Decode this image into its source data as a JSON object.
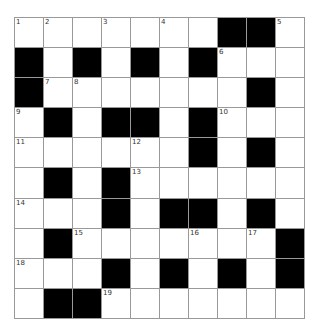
{
  "puzzle": {
    "rows": 10,
    "cols": 10,
    "grid": [
      [
        "W",
        "W",
        "W",
        "W",
        "W",
        "W",
        "W",
        "B",
        "B",
        "W"
      ],
      [
        "B",
        "W",
        "B",
        "W",
        "B",
        "W",
        "B",
        "W",
        "W",
        "W"
      ],
      [
        "B",
        "W",
        "W",
        "W",
        "W",
        "W",
        "W",
        "W",
        "B",
        "W"
      ],
      [
        "W",
        "B",
        "W",
        "B",
        "B",
        "W",
        "B",
        "W",
        "W",
        "W"
      ],
      [
        "W",
        "W",
        "W",
        "W",
        "W",
        "W",
        "B",
        "W",
        "B",
        "W"
      ],
      [
        "W",
        "B",
        "W",
        "B",
        "W",
        "W",
        "W",
        "W",
        "W",
        "W"
      ],
      [
        "W",
        "W",
        "W",
        "B",
        "W",
        "B",
        "B",
        "W",
        "B",
        "W"
      ],
      [
        "W",
        "B",
        "W",
        "W",
        "W",
        "W",
        "W",
        "W",
        "W",
        "B"
      ],
      [
        "W",
        "W",
        "W",
        "B",
        "W",
        "B",
        "W",
        "B",
        "W",
        "B"
      ],
      [
        "W",
        "B",
        "B",
        "W",
        "W",
        "W",
        "W",
        "W",
        "W",
        "W"
      ]
    ],
    "numbers": [
      {
        "r": 0,
        "c": 0,
        "n": "1"
      },
      {
        "r": 0,
        "c": 1,
        "n": "2"
      },
      {
        "r": 0,
        "c": 3,
        "n": "3"
      },
      {
        "r": 0,
        "c": 5,
        "n": "4"
      },
      {
        "r": 0,
        "c": 9,
        "n": "5"
      },
      {
        "r": 1,
        "c": 7,
        "n": "6"
      },
      {
        "r": 2,
        "c": 1,
        "n": "7"
      },
      {
        "r": 2,
        "c": 2,
        "n": "8"
      },
      {
        "r": 3,
        "c": 0,
        "n": "9"
      },
      {
        "r": 3,
        "c": 7,
        "n": "10"
      },
      {
        "r": 4,
        "c": 0,
        "n": "11"
      },
      {
        "r": 4,
        "c": 4,
        "n": "12"
      },
      {
        "r": 5,
        "c": 4,
        "n": "13"
      },
      {
        "r": 6,
        "c": 0,
        "n": "14"
      },
      {
        "r": 7,
        "c": 2,
        "n": "15"
      },
      {
        "r": 7,
        "c": 6,
        "n": "16"
      },
      {
        "r": 7,
        "c": 8,
        "n": "17"
      },
      {
        "r": 8,
        "c": 0,
        "n": "18"
      },
      {
        "r": 9,
        "c": 3,
        "n": "19"
      }
    ],
    "colors": {
      "block": "#000000",
      "cell": "#ffffff",
      "gridline": "#999999"
    }
  }
}
